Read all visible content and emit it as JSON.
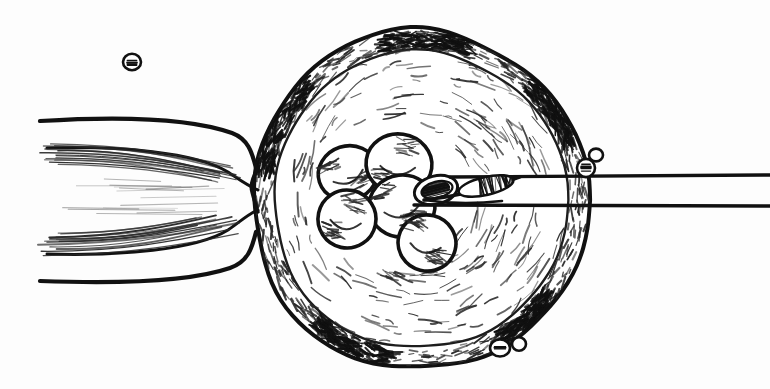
{
  "illustration": {
    "title": "Embryo biopsy micromanipulation",
    "subject": "Cleavage-stage mammalian embryo within zona pellucida held by a holding pipette while a beveled biopsy pipette aspirates a blastomere",
    "technique": "pen-and-ink line drawing with cross-hatching",
    "background_color": "#fdfdfd",
    "ink_color": "#111111",
    "hatch_color": "#2a2a2a",
    "canvas": {
      "width": 770,
      "height": 389
    }
  },
  "scene": {
    "zona_pellucida": {
      "label": "zona pellucida",
      "center_x": 420,
      "center_y": 200,
      "radius_x": 168,
      "radius_y": 170,
      "outline_style": "double contour with dense hatching between",
      "stroke_width": 4
    },
    "embryo_cells": {
      "label": "blastomeres",
      "count": 6,
      "cluster_center_x": 390,
      "cluster_center_y": 195,
      "cells": [
        {
          "name": "blastomere-upper-left",
          "cx": 348,
          "cy": 173,
          "rx": 30,
          "ry": 27,
          "rot": -18
        },
        {
          "name": "blastomere-upper-right",
          "cx": 399,
          "cy": 164,
          "rx": 33,
          "ry": 30,
          "rot": 8
        },
        {
          "name": "blastomere-center",
          "cx": 402,
          "cy": 206,
          "rx": 33,
          "ry": 31,
          "rot": -6
        },
        {
          "name": "blastomere-lower-left",
          "cx": 347,
          "cy": 219,
          "rx": 29,
          "ry": 29,
          "rot": 12
        },
        {
          "name": "blastomere-lower-right",
          "cx": 427,
          "cy": 243,
          "rx": 29,
          "ry": 28,
          "rot": 14
        },
        {
          "name": "blastomere-aspirated",
          "cx": 436,
          "cy": 190,
          "rx": 22,
          "ry": 14,
          "rot": -14
        }
      ]
    },
    "holding_pipette": {
      "label": "holding pipette",
      "side": "left",
      "tip_x": 258,
      "upper_edge_y": 118,
      "lower_edge_y": 272,
      "suction_note": "zona drawn into pipette lumen by negative pressure"
    },
    "biopsy_pipette": {
      "label": "biopsy / injection pipette",
      "side": "right",
      "tip_x": 424,
      "upper_edge_y": 177,
      "lower_edge_y": 205,
      "bevel_note": "beveled open tip with elliptical lumen",
      "exits_at_x": 770
    },
    "debris_particles": [
      {
        "name": "particle-upper-left",
        "cx": 132,
        "cy": 62,
        "r": 9,
        "filled": false
      },
      {
        "name": "particle-right-edge",
        "cx": 596,
        "cy": 155,
        "r": 7,
        "filled": false
      },
      {
        "name": "particle-zona-right",
        "cx": 586,
        "cy": 168,
        "r": 9,
        "filled": false
      },
      {
        "name": "particle-bottom-a",
        "cx": 500,
        "cy": 348,
        "r": 10,
        "filled": false
      },
      {
        "name": "particle-bottom-b",
        "cx": 519,
        "cy": 344,
        "r": 7,
        "filled": false
      }
    ]
  }
}
